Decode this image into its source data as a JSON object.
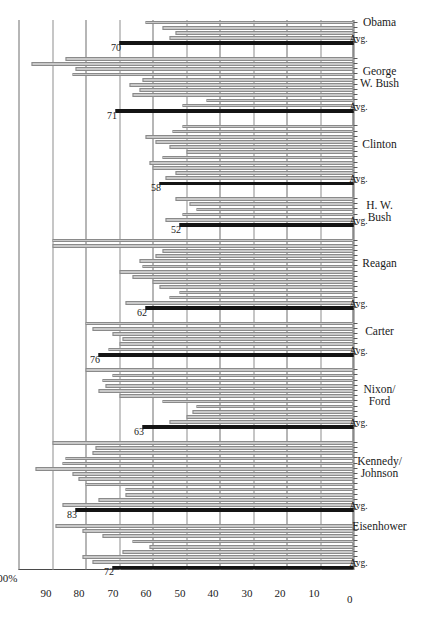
{
  "chart_data": {
    "type": "bar",
    "title": "",
    "xlabel": "",
    "ylabel": "",
    "ylim": [
      0,
      100
    ],
    "grid": true,
    "legend_position": "none",
    "orientation": "horizontal-rotated",
    "axis_label_top": "100%",
    "ytick_labels": [
      "100%",
      "90",
      "80",
      "70",
      "60",
      "50",
      "40",
      "30",
      "20",
      "10",
      "0"
    ],
    "ytick_values": [
      100,
      90,
      80,
      70,
      60,
      50,
      40,
      30,
      20,
      10,
      0
    ],
    "avg_caption": "Avg.",
    "groups": [
      {
        "name": "Eisenhower",
        "avg_label": "72",
        "avg_value": 72,
        "values": [
          72,
          78,
          81,
          69,
          61,
          66,
          75,
          81,
          89
        ]
      },
      {
        "name": "Kennedy/\nJohnson",
        "avg_label": "83",
        "avg_value": 83,
        "values": [
          83,
          87,
          76,
          68,
          68,
          80,
          82,
          84,
          95,
          87,
          86,
          78,
          77,
          90
        ]
      },
      {
        "name": "Nixon/\nFord",
        "avg_label": "63",
        "avg_value": 63,
        "values": [
          63,
          55,
          50,
          48,
          47,
          57,
          70,
          76,
          74,
          75,
          72,
          80
        ]
      },
      {
        "name": "Carter",
        "avg_label": "76",
        "avg_value": 76,
        "values": [
          76,
          73,
          70,
          69,
          72,
          78,
          80
        ]
      },
      {
        "name": "Reagan",
        "avg_label": "62",
        "avg_value": 62,
        "values": [
          62,
          68,
          55,
          52,
          58,
          60,
          66,
          70,
          63,
          64,
          59,
          57,
          90,
          90
        ]
      },
      {
        "name": "H. W.\nBush",
        "avg_label": "52",
        "avg_value": 52,
        "values": [
          52,
          56,
          51,
          47,
          49,
          53
        ]
      },
      {
        "name": "Clinton",
        "avg_label": "58",
        "avg_value": 58,
        "values": [
          58,
          56,
          53,
          60,
          61,
          57,
          50,
          55,
          59,
          62,
          54,
          51
        ]
      },
      {
        "name": "George\nW. Bush",
        "avg_label": "71",
        "avg_value": 71,
        "values": [
          71,
          51,
          44,
          66,
          64,
          67,
          63,
          84,
          83,
          96,
          86
        ]
      },
      {
        "name": "Obama",
        "avg_label": "70",
        "avg_value": 70,
        "values": [
          70,
          55,
          53,
          57,
          62
        ]
      }
    ]
  }
}
